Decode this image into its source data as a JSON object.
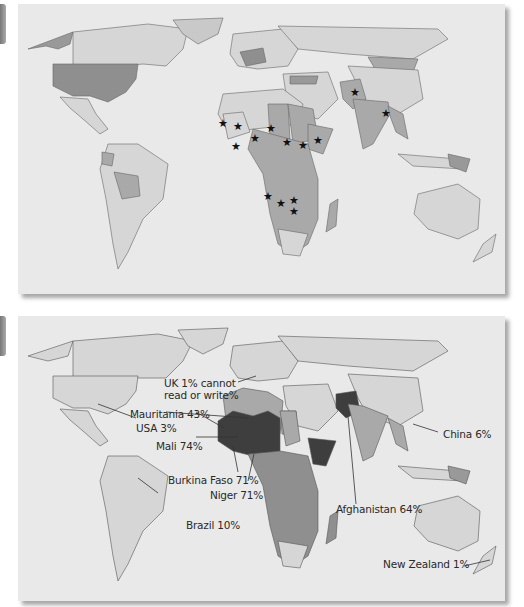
{
  "figure": {
    "panels": [
      {
        "id": "top",
        "description": "World map with shaded countries and star markers",
        "markers": {
          "icon": "star",
          "locations": [
            "Mauritania",
            "Mali",
            "Burkina Faso",
            "Niger",
            "Chad",
            "Sudan",
            "Ethiopia",
            "Somalia",
            "Angola",
            "Zambia",
            "Malawi",
            "Mozambique",
            "Afghanistan",
            "Bangladesh"
          ]
        }
      },
      {
        "id": "bottom",
        "description": "World map of adult illiteracy rates",
        "labels": {
          "uk": "UK 1% cannot",
          "uk_line2": "read or write%",
          "mauritania": "Mauritania 43%",
          "usa": "USA 3%",
          "mali": "Mali 74%",
          "burkina": "Burkina Faso 71%",
          "niger": "Niger 71%",
          "brazil": "Brazil 10%",
          "afghanistan": "Afghanistan 64%",
          "china": "China 6%",
          "nz": "New Zealand 1%"
        }
      }
    ],
    "colors": {
      "sea": "#e9e9e9",
      "land_light": "#d6d6d6",
      "land_mid": "#a9a9a9",
      "land_dark": "#8a8a8a",
      "land_darkest": "#3e3e3e",
      "border": "#555555"
    }
  }
}
